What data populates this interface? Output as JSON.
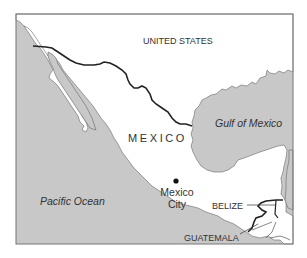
{
  "map": {
    "colors": {
      "water": "#c8c8c8",
      "land": "#ffffff",
      "border": "#222222",
      "frame": "#777777",
      "label": "#333333"
    },
    "labels": {
      "united_states": "UNITED STATES",
      "mexico": "MEXICO",
      "gulf_of_mexico": "Gulf of Mexico",
      "pacific_ocean": "Pacific Ocean",
      "mexico_city_line1": "Mexico",
      "mexico_city_line2": "City",
      "belize": "BELIZE",
      "guatemala": "GUATEMALA"
    },
    "markers": [
      {
        "name": "Mexico City",
        "type": "capital-dot"
      }
    ]
  }
}
